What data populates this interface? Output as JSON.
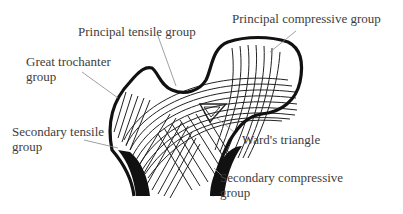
{
  "figure": {
    "labels": {
      "principal_tensile": "Principal tensile group",
      "principal_compressive": "Principal compressive group",
      "great_trochanter_line1": "Great trochanter",
      "great_trochanter_line2": "group",
      "secondary_tensile_line1": "Secondary tensile",
      "secondary_tensile_line2": "group",
      "wards_triangle": "Ward's triangle",
      "secondary_compressive_line1": "Secondary compressive",
      "secondary_compressive_line2": "group"
    },
    "colors": {
      "outline": "#111111",
      "trabeculae": "#222222",
      "leader_lines": "#888888",
      "text": "#3d3d3d",
      "background": "#ffffff"
    }
  }
}
